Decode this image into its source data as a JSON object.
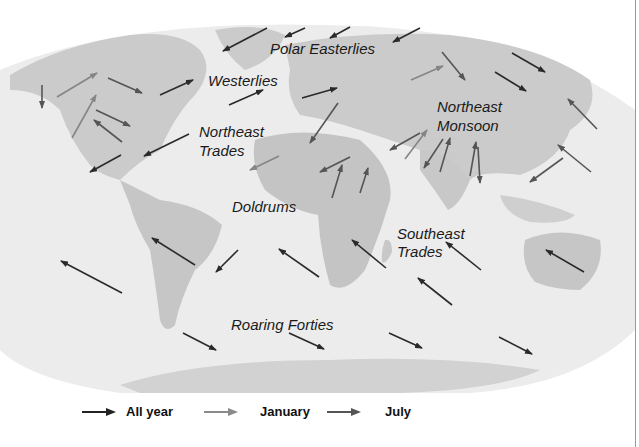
{
  "figure": {
    "labels": {
      "polar_easterlies": "Polar Easterlies",
      "westerlies": "Westerlies",
      "northeast_trades_1": "Northeast",
      "northeast_trades_2": "Trades",
      "northeast_monsoon_1": "Northeast",
      "northeast_monsoon_2": "Monsoon",
      "doldrums": "Doldrums",
      "southeast_trades_1": "Southeast",
      "southeast_trades_2": "Trades",
      "roaring_forties": "Roaring Forties"
    }
  },
  "legend": {
    "items": [
      {
        "label": "All year",
        "color": "#222222",
        "icon": "arrow-right-icon"
      },
      {
        "label": "January",
        "color": "#8a8a8a",
        "icon": "arrow-right-icon"
      },
      {
        "label": "July",
        "color": "#555555",
        "icon": "arrow-right-icon"
      }
    ]
  },
  "colors": {
    "ocean": "#efefef",
    "land": "#c9c9c9",
    "arrow_all_year": "#222222",
    "arrow_january": "#8a8a8a",
    "arrow_july": "#555555"
  }
}
